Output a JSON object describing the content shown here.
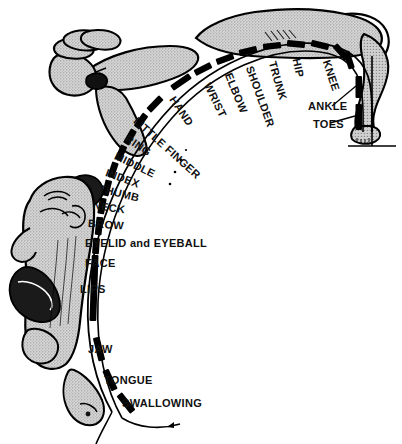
{
  "figure": {
    "background_color": "#ffffff",
    "ink_color": "#000000",
    "body_fill_color": "#c8c8c8",
    "type": "anatomical-diagram"
  },
  "arc_labels": [
    {
      "id": "toes",
      "text": "TOES"
    },
    {
      "id": "ankle",
      "text": "ANKLE"
    },
    {
      "id": "knee",
      "text": "KNEE"
    },
    {
      "id": "hip",
      "text": "HIP"
    },
    {
      "id": "trunk",
      "text": "TRUNK"
    },
    {
      "id": "shoulder",
      "text": "SHOULDER"
    },
    {
      "id": "elbow",
      "text": "ELBOW"
    },
    {
      "id": "wrist",
      "text": "WRIST"
    },
    {
      "id": "hand",
      "text": "HAND"
    },
    {
      "id": "little-finger",
      "text": "LITTLE FINGER"
    },
    {
      "id": "ring",
      "text": "RING"
    },
    {
      "id": "middle",
      "text": "MIDDLE"
    },
    {
      "id": "index",
      "text": "INDEX"
    },
    {
      "id": "thumb",
      "text": "THUMB"
    },
    {
      "id": "neck",
      "text": "NECK"
    },
    {
      "id": "brow",
      "text": "BROW"
    },
    {
      "id": "eyelid-eyeball",
      "text": "EYELID and EYEBALL"
    },
    {
      "id": "face",
      "text": "FACE"
    },
    {
      "id": "lips",
      "text": "LIPS"
    },
    {
      "id": "jaw",
      "text": "JAW"
    },
    {
      "id": "tongue",
      "text": "TONGUE"
    },
    {
      "id": "swallowing",
      "text": "SWALLOWING"
    }
  ],
  "dash_markers": {
    "count": 22,
    "color": "#000000",
    "description": "thick black dashes along cortical arc"
  },
  "leaders": {
    "ankle_leader": "line from ANKLE label to upper vertical dash",
    "toes_leader": "line from TOES label to lower vertical dash"
  },
  "body_figure": {
    "parts": [
      "hand",
      "arm",
      "head-profile",
      "lips",
      "tongue",
      "trunk",
      "leg",
      "foot"
    ],
    "description": "distorted homunculus body drawn outside the arc"
  }
}
